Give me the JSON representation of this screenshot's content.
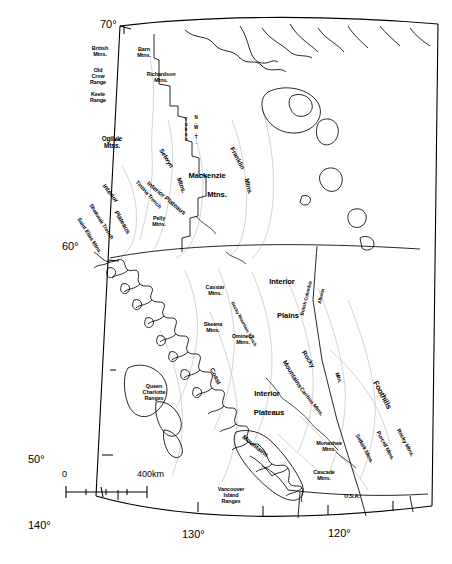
{
  "figure": {
    "type": "map",
    "width": 452,
    "height": 564,
    "background_color": "#ffffff",
    "line_color": "#000000",
    "light_line_color": "#b9b9b9"
  },
  "graticule": {
    "latitude_labels": [
      {
        "text": "70°",
        "x": 100,
        "y": 18,
        "size": "xl"
      },
      {
        "text": "60°",
        "x": 62,
        "y": 240,
        "size": "xl"
      },
      {
        "text": "50°",
        "x": 28,
        "y": 453,
        "size": "xl"
      }
    ],
    "longitude_labels": [
      {
        "text": "140°",
        "x": 28,
        "y": 519,
        "size": "xl"
      },
      {
        "text": "130°",
        "x": 182,
        "y": 528,
        "size": "xl"
      },
      {
        "text": "120°",
        "x": 328,
        "y": 527,
        "size": "xl"
      }
    ]
  },
  "scale_bar": {
    "zero_label": "0",
    "distance_label": "400km",
    "zero_x": 62,
    "zero_y": 469,
    "distance_x": 137,
    "distance_y": 469,
    "bar_left": 66,
    "bar_right": 147,
    "bar_y": 492,
    "ticks": 4
  },
  "boundary_labels": [
    {
      "id": "yukon-nwt-yukon",
      "text": "Y\nu\nk\no\nn",
      "x": 186,
      "y": 118,
      "size": "tiny",
      "rotate": 0,
      "width": 8
    },
    {
      "id": "yukon-nwt-nwt",
      "text": "N\n.\nW\n.\nT\n.",
      "x": 196,
      "y": 116,
      "size": "tiny",
      "rotate": 0,
      "width": 8
    },
    {
      "id": "bc-border",
      "text": "British Columbia",
      "x": 307,
      "y": 296,
      "size": "tiny",
      "rotate": -76,
      "width": 62
    },
    {
      "id": "ab-border",
      "text": "Alberta",
      "x": 322,
      "y": 294,
      "size": "tiny",
      "rotate": -76,
      "width": 34
    },
    {
      "id": "usa-border",
      "text": "U.S.A.",
      "x": 352,
      "y": 494,
      "size": "sm",
      "rotate": 0,
      "width": 30
    }
  ],
  "physiographic_labels": [
    {
      "id": "british-mtns",
      "text": "British\nMtns.",
      "x": 100,
      "y": 46,
      "size": "sm",
      "rotate": 0,
      "width": 34
    },
    {
      "id": "old-crow-range",
      "text": "Old\nCrow\nRange",
      "x": 98,
      "y": 68,
      "size": "sm",
      "rotate": 0,
      "width": 34
    },
    {
      "id": "keele-range",
      "text": "Keele\nRange",
      "x": 98,
      "y": 92,
      "size": "sm",
      "rotate": 0,
      "width": 34
    },
    {
      "id": "barn-mtns",
      "text": "Barn\nMtns.",
      "x": 144,
      "y": 47,
      "size": "sm",
      "rotate": 0,
      "width": 32
    },
    {
      "id": "richardson-mtns",
      "text": "Richardson\nMtns.",
      "x": 161,
      "y": 72,
      "size": "sm",
      "rotate": 0,
      "width": 46
    },
    {
      "id": "ogilvie-mtns",
      "text": "Ogilvie\nMtns.",
      "x": 112,
      "y": 136,
      "size": "md",
      "rotate": 0,
      "width": 40
    },
    {
      "id": "selwyn-mtns",
      "text": "Selwyn",
      "x": 166,
      "y": 155,
      "size": "md",
      "rotate": 58,
      "width": 38
    },
    {
      "id": "selwyn-mtns-2",
      "text": "Mtns.",
      "x": 181,
      "y": 182,
      "size": "md",
      "rotate": 70,
      "width": 30
    },
    {
      "id": "mackenzie-mtns",
      "text": "Mackenzie",
      "x": 207,
      "y": 172,
      "size": "lg",
      "rotate": 0,
      "width": 56
    },
    {
      "id": "mackenzie-mtns-2",
      "text": "Mtns.",
      "x": 217,
      "y": 191,
      "size": "lg",
      "rotate": 0,
      "width": 34
    },
    {
      "id": "franklin-mtns",
      "text": "Franklin",
      "x": 237,
      "y": 155,
      "size": "md",
      "rotate": 62,
      "width": 40
    },
    {
      "id": "franklin-mtns-2",
      "text": "Mtns.",
      "x": 248,
      "y": 183,
      "size": "md",
      "rotate": 76,
      "width": 30
    },
    {
      "id": "interior-plateaus-north",
      "text": "Interior  Plateaus",
      "x": 166,
      "y": 195,
      "size": "md",
      "rotate": 40,
      "width": 82
    },
    {
      "id": "tintina-trench",
      "text": "Tintina  Trench",
      "x": 148,
      "y": 192,
      "size": "sm",
      "rotate": 48,
      "width": 68
    },
    {
      "id": "interior-north",
      "text": "Interior",
      "x": 110,
      "y": 190,
      "size": "md",
      "rotate": 52,
      "width": 40
    },
    {
      "id": "plateaus-north-2",
      "text": "Plateaus",
      "x": 122,
      "y": 219,
      "size": "md",
      "rotate": 60,
      "width": 44
    },
    {
      "id": "pelly-mtns",
      "text": "Pelly\nMtns.",
      "x": 159,
      "y": 216,
      "size": "sm",
      "rotate": 0,
      "width": 30
    },
    {
      "id": "shakwak-trench",
      "text": "Shakwak  Trench",
      "x": 101,
      "y": 219,
      "size": "sm",
      "rotate": 58,
      "width": 72
    },
    {
      "id": "saint-elias-mtns",
      "text": "Saint  Elias  Mtns.",
      "x": 89,
      "y": 233,
      "size": "sm",
      "rotate": 58,
      "width": 76
    },
    {
      "id": "cassiar-mtns",
      "text": "Cassiar\nMtns.",
      "x": 215,
      "y": 285,
      "size": "sm",
      "rotate": 0,
      "width": 38
    },
    {
      "id": "skeena-mtns",
      "text": "Skeena\nMtns.",
      "x": 213,
      "y": 322,
      "size": "sm",
      "rotate": 0,
      "width": 38
    },
    {
      "id": "omineca-mtns",
      "text": "Omineca\nMtns.",
      "x": 243,
      "y": 334,
      "size": "sm",
      "rotate": 0,
      "width": 42
    },
    {
      "id": "interior-plains",
      "text": "Interior",
      "x": 282,
      "y": 278,
      "size": "lg",
      "rotate": 0,
      "width": 42
    },
    {
      "id": "interior-plains-2",
      "text": "Plains",
      "x": 288,
      "y": 312,
      "size": "lg",
      "rotate": 0,
      "width": 38
    },
    {
      "id": "rocky-mountain-trench",
      "text": "Rocky  Mountain  Trench",
      "x": 243,
      "y": 322,
      "size": "tiny",
      "rotate": 62,
      "width": 86
    },
    {
      "id": "rocky-mountains",
      "text": "Rocky",
      "x": 308,
      "y": 356,
      "size": "md",
      "rotate": 58,
      "width": 36
    },
    {
      "id": "rocky-mountains-2",
      "text": "Mountains",
      "x": 292,
      "y": 371,
      "size": "md",
      "rotate": 58,
      "width": 52
    },
    {
      "id": "coast-mountains",
      "text": "Coast",
      "x": 215,
      "y": 373,
      "size": "md",
      "rotate": 64,
      "width": 34
    },
    {
      "id": "coast-mountains-2",
      "text": "Mountains",
      "x": 255,
      "y": 443,
      "size": "md",
      "rotate": 38,
      "width": 54
    },
    {
      "id": "queen-charlotte-ranges",
      "text": "Queen\nCharlotte\nRanges",
      "x": 154,
      "y": 384,
      "size": "sm",
      "rotate": 0,
      "width": 48
    },
    {
      "id": "interior-plateaus-south",
      "text": "Interior",
      "x": 267,
      "y": 390,
      "size": "lg",
      "rotate": 0,
      "width": 42
    },
    {
      "id": "interior-plateaus-south-2",
      "text": "Plateaus",
      "x": 269,
      "y": 409,
      "size": "lg",
      "rotate": 0,
      "width": 48
    },
    {
      "id": "cariboo-mtns",
      "text": "Cariboo  Mtns.",
      "x": 311,
      "y": 399,
      "size": "sm",
      "rotate": 52,
      "width": 56
    },
    {
      "id": "mtns-foothills-edge",
      "text": "Mtn.",
      "x": 338,
      "y": 375,
      "size": "sm",
      "rotate": 72,
      "width": 24
    },
    {
      "id": "foothills",
      "text": "Foothills",
      "x": 382,
      "y": 391,
      "size": "lg",
      "rotate": 62,
      "width": 50
    },
    {
      "id": "monashee-mtns",
      "text": "Monashee\nMtns.",
      "x": 329,
      "y": 441,
      "size": "sm",
      "rotate": 0,
      "width": 46
    },
    {
      "id": "cascade-mtns",
      "text": "Cascade\nMtns.",
      "x": 324,
      "y": 470,
      "size": "sm",
      "rotate": 0,
      "width": 42
    },
    {
      "id": "selkirk-mtns",
      "text": "Selkirk  Mtns.",
      "x": 364,
      "y": 446,
      "size": "sm",
      "rotate": 62,
      "width": 52
    },
    {
      "id": "purcell-mtns",
      "text": "Purcell  Mtns.",
      "x": 385,
      "y": 443,
      "size": "sm",
      "rotate": 62,
      "width": 52
    },
    {
      "id": "rocky-mtns-south",
      "text": "Rocky  Mtns.",
      "x": 405,
      "y": 440,
      "size": "sm",
      "rotate": 62,
      "width": 50
    },
    {
      "id": "vancouver-island-ranges",
      "text": "Vancouver\nIsland\nRanges",
      "x": 231,
      "y": 487,
      "size": "sm",
      "rotate": 0,
      "width": 48
    }
  ]
}
